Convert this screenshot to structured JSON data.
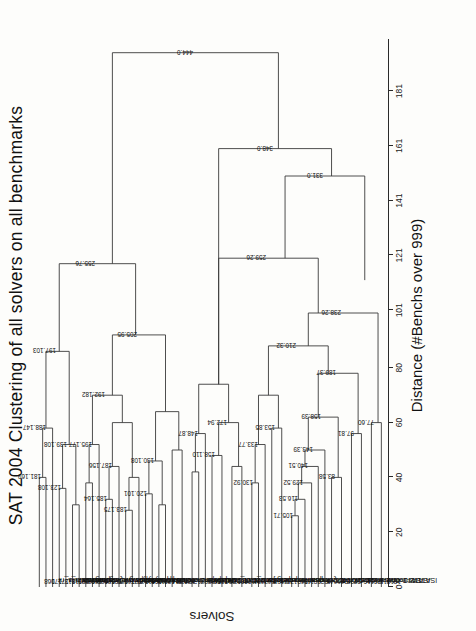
{
  "figure": {
    "title": "SAT 2004 Clustering of all solvers on all benchmarks",
    "axis_title": "Distance (#Benchs over 999)",
    "y_axis_label": "Solvers"
  },
  "chart_data": {
    "type": "dendrogram",
    "title": "SAT 2004 Clustering of all solvers on all benchmarks",
    "xlabel": "Distance (#Benchs over 999)",
    "ylabel": "Solvers",
    "orientation": "horizontal",
    "grid": false,
    "legend": "none",
    "xlim": [
      0,
      200
    ],
    "ticks": [
      0,
      20,
      40,
      60,
      80,
      101,
      121,
      141,
      161,
      181
    ],
    "tick_labels": [
      "0",
      "20",
      "40",
      "60",
      "80",
      "101",
      "121",
      "141",
      "161",
      "181"
    ],
    "leaves": [
      {
        "id": "168",
        "name": "satzilla_nr"
      },
      {
        "id": "170",
        "name": "satzilla_r"
      },
      {
        "id": "171",
        "name": "satzilla"
      },
      {
        "id": "113",
        "name": "UnitWalk"
      },
      {
        "id": "118",
        "name": "saprover"
      },
      {
        "id": "133",
        "name": "QingTing"
      },
      {
        "id": "136",
        "name": "walksatskc"
      },
      {
        "id": "168",
        "name": "walksatauto"
      },
      {
        "id": "188",
        "name": "satsnr"
      },
      {
        "id": "186",
        "name": "saps"
      },
      {
        "id": "185",
        "name": "rsaps"
      },
      {
        "id": "170",
        "name": "walksatlng"
      },
      {
        "id": "168",
        "name": "novelty35"
      },
      {
        "id": "177",
        "name": "novelty50"
      },
      {
        "id": "179",
        "name": "adaptnovelty"
      },
      {
        "id": "111",
        "name": "GaSAT"
      },
      {
        "id": "108",
        "name": "march-eq-100"
      },
      {
        "id": "113",
        "name": "march-eq-010"
      },
      {
        "id": "124",
        "name": "march-007"
      },
      {
        "id": "114",
        "name": "march-001"
      },
      {
        "id": "138",
        "name": "OepirC"
      },
      {
        "id": "134",
        "name": "OepirB"
      },
      {
        "id": "134",
        "name": "OepirA"
      },
      {
        "id": "87",
        "name": "CirCUsH0"
      },
      {
        "id": "89",
        "name": "CirCUsUs"
      },
      {
        "id": "80",
        "name": "CirCUsH1"
      },
      {
        "id": "105",
        "name": "zchaff_rand"
      },
      {
        "id": "117",
        "name": "zchaff"
      },
      {
        "id": "124",
        "name": "Forklift"
      },
      {
        "id": "106",
        "name": "Satzoo_1.02"
      },
      {
        "id": "104",
        "name": "Jerusat1.3"
      },
      {
        "id": "81",
        "name": "eqube2"
      },
      {
        "id": "76",
        "name": "eqube1"
      },
      {
        "id": "86",
        "name": "nanosat"
      },
      {
        "id": "82",
        "name": "minilearning.jar"
      },
      {
        "id": "71",
        "name": "quantor"
      },
      {
        "id": "70",
        "name": "funex"
      },
      {
        "id": "91",
        "name": "compsat"
      },
      {
        "id": "86",
        "name": "CQuest"
      },
      {
        "id": "111",
        "name": "brchaff"
      },
      {
        "id": "89",
        "name": "kcnfs"
      },
      {
        "id": "82",
        "name": "satz04:3"
      },
      {
        "id": "45",
        "name": "satz04-2"
      },
      {
        "id": "66",
        "name": "satz04"
      },
      {
        "id": "36",
        "name": "wllsatv1"
      },
      {
        "id": "39",
        "name": "lsatv11"
      },
      {
        "id": "22",
        "name": "Werewolf"
      },
      {
        "id": "0",
        "name": "ofsat"
      },
      {
        "id": "11",
        "name": "modoc"
      },
      {
        "id": "20",
        "name": "tts-2-0"
      },
      {
        "id": "15",
        "name": "lSAT3"
      },
      {
        "id": "13",
        "name": "lSAT2"
      },
      {
        "id": "13",
        "name": "lSAT1"
      }
    ],
    "merge_labels": [
      "444.0",
      "348.0",
      "331.0",
      "255.76",
      "205.95",
      "197.103",
      "188.147",
      "181.169",
      "139.108",
      "123.108",
      "192.182",
      "195.177",
      "187.156",
      "185.164",
      "183.175",
      "120.101",
      "130.108",
      "148.87",
      "172.94",
      "158.110",
      "259.26",
      "238.26",
      "210.32",
      "189.37",
      "133.77",
      "130.92",
      "153.85",
      "105.71",
      "97.81",
      "77.60",
      "83.58",
      "158.39",
      "143.39",
      "140.51",
      "129.52",
      "116.53",
      "182.0",
      "151.0",
      "107.0",
      "74.37",
      "66.0",
      "54.0",
      "50.0",
      "28.0",
      "15.0",
      "6.0",
      "23.11",
      "17.11"
    ]
  }
}
